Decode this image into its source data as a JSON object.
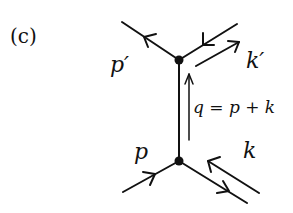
{
  "figure": {
    "panel_label": "(c)",
    "type": "feynman-diagram",
    "labels": {
      "p_prime": "p′",
      "k_prime": "k′",
      "q_relation": "q = p + k",
      "p": "p",
      "k": "k"
    },
    "vertices": [
      {
        "name": "top-vertex",
        "x": 179,
        "y": 60
      },
      {
        "name": "bottom-vertex",
        "x": 179,
        "y": 161
      }
    ],
    "lines": [
      {
        "name": "outgoing-p-prime",
        "from": [
          179,
          60
        ],
        "to": [
          122,
          22
        ],
        "arrow": "outward"
      },
      {
        "name": "external-k-prime",
        "from": [
          237,
          24
        ],
        "to": [
          179,
          60
        ],
        "arrow": "inward"
      },
      {
        "name": "propagator-q",
        "from": [
          179,
          161
        ],
        "to": [
          179,
          60
        ],
        "arrow": "none"
      },
      {
        "name": "incoming-p",
        "from": [
          123,
          192
        ],
        "to": [
          179,
          161
        ],
        "arrow": "inward"
      },
      {
        "name": "external-k",
        "from": [
          179,
          161
        ],
        "to": [
          247,
          203
        ],
        "arrow": "outward"
      }
    ],
    "momentum_arrows": [
      {
        "name": "k-prime-momentum",
        "from": [
          196,
          66
        ],
        "to": [
          240,
          42
        ]
      },
      {
        "name": "q-momentum",
        "from": [
          189,
          140
        ],
        "to": [
          189,
          73
        ]
      },
      {
        "name": "k-momentum",
        "from": [
          259,
          193
        ],
        "to": [
          207,
          161
        ]
      }
    ],
    "colors": {
      "ink": "#111111",
      "background": "#ffffff"
    }
  }
}
